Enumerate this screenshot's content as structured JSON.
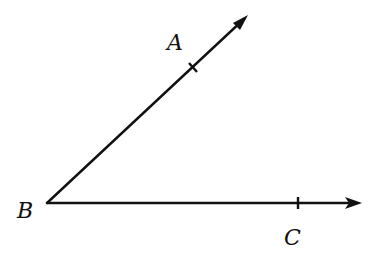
{
  "diagram": {
    "type": "angle",
    "vertex": {
      "label": "B",
      "x": 47,
      "y": 203
    },
    "rays": [
      {
        "name": "ray-BA",
        "end": {
          "x": 248,
          "y": 15
        },
        "point": {
          "label": "A",
          "x": 193,
          "y": 68
        }
      },
      {
        "name": "ray-BC",
        "end": {
          "x": 361,
          "y": 203
        },
        "point": {
          "label": "C",
          "x": 298,
          "y": 203
        }
      }
    ],
    "labels": {
      "A": "A",
      "B": "B",
      "C": "C"
    },
    "stroke_color": "#111111"
  }
}
